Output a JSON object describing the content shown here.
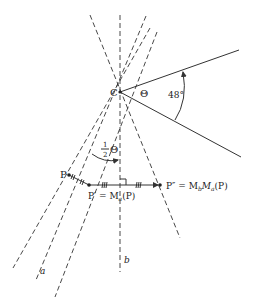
{
  "diagram": {
    "type": "geometry-reflection-composition",
    "labels": {
      "center": "C",
      "theta": "Θ",
      "angle": "48°",
      "half_num": "1",
      "half_den": "2",
      "half_theta": "Θ",
      "point_p": "P",
      "point_p_prime_lhs": "P′",
      "point_p_prime_rhs": "= M",
      "point_p_prime_sub": "a",
      "point_p_prime_arg": "(P)",
      "point_p_dprime_lhs": "P″",
      "point_p_dprime_rhs": "= M",
      "point_p_dprime_sub1": "b",
      "point_p_dprime_m2": "M",
      "point_p_dprime_sub2": "a",
      "point_p_dprime_arg": "(P)",
      "line_a": "a",
      "line_b": "b"
    },
    "angle_value_deg": 48,
    "colors": {
      "stroke": "#333333",
      "text": "#222222",
      "background": "#ffffff"
    }
  }
}
